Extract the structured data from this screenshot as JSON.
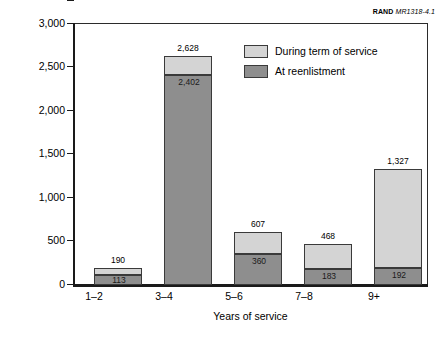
{
  "source_note": {
    "org": "RAND",
    "document_id": "MR1318-4.1"
  },
  "chart_data": {
    "type": "bar",
    "subtype": "stacked-vertical",
    "title": "",
    "xlabel": "Years of service",
    "ylabel": "Number of reclassifications in FY99",
    "categories": [
      "1–2",
      "3–4",
      "5–6",
      "7–8",
      "9+"
    ],
    "series": [
      {
        "name": "During term of service",
        "color": "#d4d4d4",
        "values": [
          77,
          226,
          247,
          285,
          1135
        ]
      },
      {
        "name": "At reenlistment",
        "color": "#8e8e8e",
        "values": [
          113,
          2402,
          360,
          183,
          192
        ]
      }
    ],
    "totals": [
      190,
      2628,
      607,
      468,
      1327
    ],
    "total_labels": [
      "190",
      "2,628",
      "607",
      "468",
      "1,327"
    ],
    "reenlistment_labels": [
      "113",
      "2,402",
      "360",
      "183",
      "192"
    ],
    "ylim": [
      0,
      3000
    ],
    "yticks": [
      0,
      500,
      1000,
      1500,
      2000,
      2500,
      3000
    ],
    "ytick_labels": [
      "0",
      "500",
      "1,000",
      "1,500",
      "2,000",
      "2,500",
      "3,000"
    ],
    "grid": false,
    "legend_position": "upper-right-inside"
  },
  "legend": {
    "items": [
      {
        "label": "During term of service",
        "color": "#d4d4d4"
      },
      {
        "label": "At reenlistment",
        "color": "#8e8e8e"
      }
    ]
  }
}
